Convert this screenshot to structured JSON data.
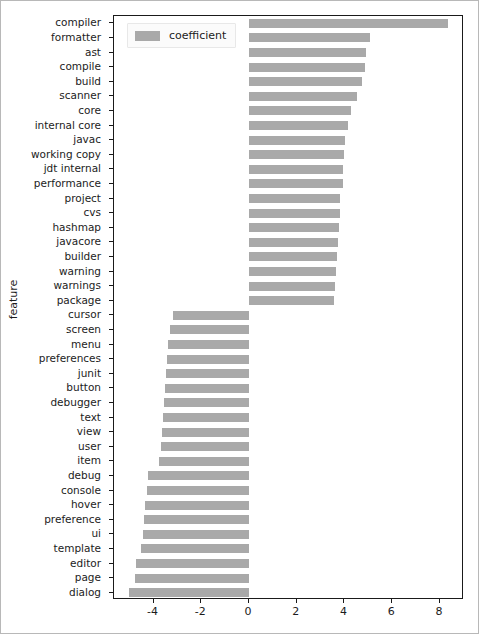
{
  "figure": {
    "background": "#ffffff",
    "bar_color": "#a9a9a9",
    "axis_color": "#1a1a1a"
  },
  "legend": {
    "label": "coefficient",
    "swatch_name": "legend-color-swatch",
    "position": "upper left"
  },
  "axes": {
    "ylabel": "feature",
    "xlabel": "",
    "xticks": [
      -4,
      -2,
      0,
      2,
      4,
      6,
      8
    ],
    "xtick_labels": [
      "-4",
      "-2",
      "0",
      "2",
      "4",
      "6",
      "8"
    ],
    "xlim": [
      -5.66,
      9.01
    ],
    "grid": false
  },
  "chart_data": {
    "type": "bar",
    "orientation": "horizontal",
    "title": "",
    "xlabel": "coefficient",
    "ylabel": "feature",
    "xlim": [
      -5.66,
      9.01
    ],
    "grid": false,
    "legend": [
      "coefficient"
    ],
    "legend_position": "upper left",
    "categories": [
      "compiler",
      "formatter",
      "ast",
      "compile",
      "build",
      "scanner",
      "core",
      "internal core",
      "javac",
      "working copy",
      "jdt internal",
      "performance",
      "project",
      "cvs",
      "hashmap",
      "javacore",
      "builder",
      "warning",
      "warnings",
      "package",
      "cursor",
      "screen",
      "menu",
      "preferences",
      "junit",
      "button",
      "debugger",
      "text",
      "view",
      "user",
      "item",
      "debug",
      "console",
      "hover",
      "preference",
      "ui",
      "template",
      "editor",
      "page",
      "dialog"
    ],
    "values": [
      8.35,
      5.08,
      4.92,
      4.88,
      4.74,
      4.52,
      4.28,
      4.13,
      4.02,
      3.98,
      3.95,
      3.92,
      3.83,
      3.8,
      3.76,
      3.72,
      3.7,
      3.66,
      3.62,
      3.55,
      -3.18,
      -3.3,
      -3.38,
      -3.42,
      -3.46,
      -3.52,
      -3.56,
      -3.62,
      -3.66,
      -3.7,
      -3.76,
      -4.22,
      -4.28,
      -4.34,
      -4.4,
      -4.46,
      -4.52,
      -4.72,
      -4.78,
      -5.04
    ],
    "series": [
      {
        "name": "coefficient",
        "color": "#a9a9a9",
        "values": [
          8.35,
          5.08,
          4.92,
          4.88,
          4.74,
          4.52,
          4.28,
          4.13,
          4.02,
          3.98,
          3.95,
          3.92,
          3.83,
          3.8,
          3.76,
          3.72,
          3.7,
          3.66,
          3.62,
          3.55,
          -3.18,
          -3.3,
          -3.38,
          -3.42,
          -3.46,
          -3.52,
          -3.56,
          -3.62,
          -3.66,
          -3.7,
          -3.76,
          -4.22,
          -4.28,
          -4.34,
          -4.4,
          -4.46,
          -4.52,
          -4.72,
          -4.78,
          -5.04
        ]
      }
    ]
  }
}
